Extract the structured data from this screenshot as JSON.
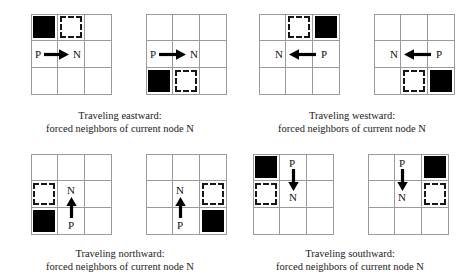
{
  "figure": {
    "colors": {
      "obstacle": "#000000",
      "forced_outline": "#161616",
      "gridline": "#9a9a9a",
      "text": "#1a1a1a",
      "background": "#ffffff"
    },
    "grid_size": "3x3",
    "labels": {
      "parent": "P",
      "node": "N"
    },
    "panels": [
      {
        "id": "eastward-a",
        "direction": "east",
        "arrow": "right-arrow-icon",
        "obstacle_cell": "top-left",
        "forced_cell": "top-middle",
        "parent_label": "P",
        "node_label": "N"
      },
      {
        "id": "eastward-b",
        "direction": "east",
        "arrow": "right-arrow-icon",
        "obstacle_cell": "bottom-left",
        "forced_cell": "bottom-middle",
        "parent_label": "P",
        "node_label": "N"
      },
      {
        "id": "westward-a",
        "direction": "west",
        "arrow": "left-arrow-icon",
        "obstacle_cell": "top-right",
        "forced_cell": "top-middle",
        "parent_label": "P",
        "node_label": "N"
      },
      {
        "id": "westward-b",
        "direction": "west",
        "arrow": "left-arrow-icon",
        "obstacle_cell": "bottom-right",
        "forced_cell": "bottom-middle",
        "parent_label": "P",
        "node_label": "N"
      },
      {
        "id": "northward-a",
        "direction": "north",
        "arrow": "up-arrow-icon",
        "obstacle_cell": "bottom-left",
        "forced_cell": "middle-left",
        "parent_label": "P",
        "node_label": "N"
      },
      {
        "id": "northward-b",
        "direction": "north",
        "arrow": "up-arrow-icon",
        "obstacle_cell": "bottom-right",
        "forced_cell": "middle-right",
        "parent_label": "P",
        "node_label": "N"
      },
      {
        "id": "southward-a",
        "direction": "south",
        "arrow": "down-arrow-icon",
        "obstacle_cell": "top-left",
        "forced_cell": "middle-left",
        "parent_label": "P",
        "node_label": "N"
      },
      {
        "id": "southward-b",
        "direction": "south",
        "arrow": "down-arrow-icon",
        "obstacle_cell": "top-right",
        "forced_cell": "middle-right",
        "parent_label": "P",
        "node_label": "N"
      }
    ],
    "captions": [
      {
        "id": "caption-eastward",
        "line1": "Traveling eastward:",
        "line2": "forced neighbors of current node N"
      },
      {
        "id": "caption-westward",
        "line1": "Traveling westward:",
        "line2": "forced neighbors of current node N"
      },
      {
        "id": "caption-northward",
        "line1": "Traveling northward:",
        "line2": "forced neighbors of current node N"
      },
      {
        "id": "caption-southward",
        "line1": "Traveling southward:",
        "line2": "forced neighbors of current node N"
      }
    ]
  }
}
